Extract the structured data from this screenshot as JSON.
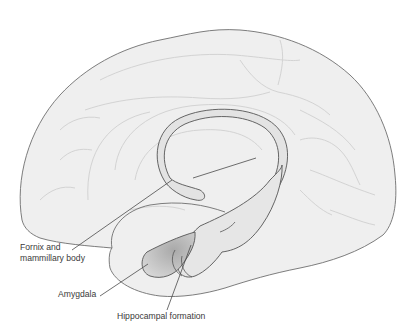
{
  "diagram": {
    "labels": {
      "fornix_line1": "Fornix and",
      "fornix_line2": "mammillary body",
      "amygdala": "Amygdala",
      "hippocampal": "Hippocampal formation"
    },
    "colors": {
      "brain_fill": "#efefef",
      "brain_stroke": "#6e6e6e",
      "gyri_stroke": "#d9d9d9",
      "structure_fill": "#e0e0e0",
      "amygdala_fill": "#c4c4c4",
      "leader_line": "#4a4a4a",
      "text": "#3a3a3a"
    }
  }
}
